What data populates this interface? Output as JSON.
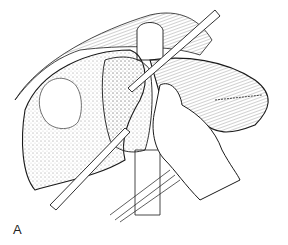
{
  "figure": {
    "panel_label": "A",
    "line_color": "#1a1a1a",
    "background": "#ffffff"
  }
}
